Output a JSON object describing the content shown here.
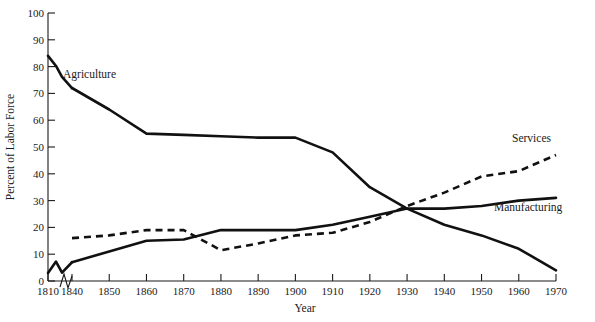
{
  "chart_data": {
    "type": "line",
    "title": "",
    "xlabel": "Year",
    "ylabel": "Percent of Labor Force",
    "xlim": [
      1810,
      1970
    ],
    "ylim": [
      0,
      100
    ],
    "grid": false,
    "legend": "inline-annotations",
    "axis_break": "between 1810 and 1840",
    "x_tick_labels": [
      "1810",
      "1840",
      "1850",
      "1860",
      "1870",
      "1880",
      "1890",
      "1900",
      "1910",
      "1920",
      "1930",
      "1940",
      "1950",
      "1960",
      "1970"
    ],
    "y_tick_labels": [
      "0",
      "10",
      "20",
      "30",
      "40",
      "50",
      "60",
      "70",
      "80",
      "90",
      "100"
    ],
    "x": [
      1810,
      1840,
      1850,
      1860,
      1870,
      1880,
      1890,
      1900,
      1910,
      1920,
      1930,
      1940,
      1950,
      1960,
      1970
    ],
    "series": [
      {
        "name": "Agriculture",
        "style": "solid",
        "values": [
          84,
          72,
          64,
          55,
          54.5,
          54,
          53.5,
          53.5,
          48,
          35,
          27,
          21,
          17,
          12,
          4
        ]
      },
      {
        "name": "Manufacturing",
        "style": "solid",
        "values": [
          3,
          7,
          11,
          15,
          15.5,
          19,
          19,
          19,
          21,
          24,
          27,
          27,
          28,
          30,
          31
        ]
      },
      {
        "name": "Services",
        "style": "dashed",
        "values": [
          null,
          16,
          17,
          19,
          19,
          11.5,
          14,
          17,
          18,
          22,
          28,
          33,
          39,
          41,
          47
        ]
      }
    ],
    "annotations": [
      {
        "text": "Agriculture",
        "x": 1843,
        "y": 76
      },
      {
        "text": "Services",
        "x": 1954,
        "y": 55
      },
      {
        "text": "Manufacturing",
        "x": 1948,
        "y": 31
      }
    ]
  }
}
